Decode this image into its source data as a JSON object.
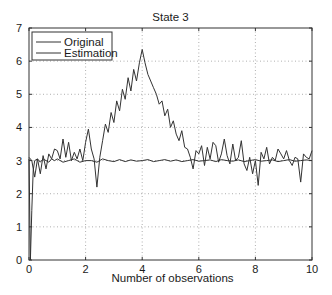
{
  "chart_data": {
    "type": "line",
    "title": "State 3",
    "xlabel": "Number of observations",
    "ylabel": "",
    "xlim": [
      0,
      10
    ],
    "ylim": [
      0,
      7
    ],
    "xticks": [
      0,
      2,
      4,
      6,
      8,
      10
    ],
    "yticks": [
      0,
      1,
      2,
      3,
      4,
      5,
      6,
      7
    ],
    "grid": true,
    "grid_style": "dotted",
    "legend": {
      "position": "upper-left",
      "entries": [
        "Original",
        "Estimation"
      ]
    },
    "series": [
      {
        "name": "Original",
        "color": "#333333",
        "x": [
          0.0,
          0.1,
          0.2,
          0.3,
          0.4,
          0.5,
          0.6,
          0.7,
          0.8,
          0.9,
          1.0,
          1.1,
          1.2,
          1.3,
          1.4,
          1.5,
          1.6,
          1.7,
          1.8,
          1.9,
          2.0,
          2.1,
          2.2,
          2.3,
          2.4,
          2.5,
          2.6,
          2.7,
          2.8,
          2.9,
          3.0,
          3.1,
          3.2,
          3.3,
          3.4,
          3.5,
          3.6,
          3.7,
          3.8,
          3.9,
          4.0,
          4.1,
          4.2,
          4.3,
          4.4,
          4.5,
          4.6,
          4.7,
          4.8,
          4.9,
          5.0,
          5.1,
          5.2,
          5.3,
          5.4,
          5.5,
          5.6,
          5.7,
          5.8,
          5.9,
          6.0,
          6.1,
          6.2,
          6.3,
          6.4,
          6.5,
          6.6,
          6.7,
          6.8,
          6.9,
          7.0,
          7.1,
          7.2,
          7.3,
          7.4,
          7.5,
          7.6,
          7.7,
          7.8,
          7.9,
          8.0,
          8.1,
          8.2,
          8.3,
          8.4,
          8.5,
          8.6,
          8.7,
          8.8,
          8.9,
          9.0,
          9.1,
          9.2,
          9.3,
          9.4,
          9.5,
          9.6,
          9.7,
          9.8,
          9.9,
          10.0
        ],
        "y": [
          3.1,
          3.0,
          2.5,
          3.05,
          2.6,
          3.15,
          2.75,
          3.2,
          3.05,
          3.35,
          3.3,
          3.05,
          3.65,
          3.1,
          3.55,
          3.0,
          3.25,
          3.05,
          3.35,
          3.0,
          3.55,
          3.95,
          3.35,
          3.05,
          2.2,
          3.1,
          3.6,
          4.1,
          3.85,
          4.45,
          4.15,
          4.8,
          4.5,
          5.15,
          4.85,
          5.5,
          5.1,
          5.75,
          5.4,
          5.95,
          6.35,
          5.95,
          5.6,
          5.4,
          5.2,
          5.0,
          4.7,
          4.8,
          4.35,
          4.55,
          4.0,
          4.2,
          3.8,
          3.6,
          3.9,
          3.4,
          3.35,
          3.1,
          2.75,
          3.3,
          3.2,
          3.45,
          2.85,
          3.4,
          3.05,
          3.55,
          3.45,
          2.95,
          3.2,
          3.65,
          3.15,
          2.9,
          3.5,
          3.0,
          3.1,
          3.6,
          2.9,
          2.7,
          3.1,
          2.6,
          3.0,
          2.25,
          3.25,
          3.05,
          3.4,
          2.9,
          3.1,
          3.0,
          3.35,
          3.2,
          3.05,
          3.3,
          3.0,
          2.85,
          3.1,
          3.05,
          2.35,
          3.2,
          3.1,
          3.05,
          3.3
        ]
      },
      {
        "name": "Estimation",
        "color": "#333333",
        "x": [
          0.0,
          0.05,
          0.1,
          0.15,
          0.2,
          0.3,
          0.4,
          0.5,
          0.6,
          0.7,
          0.8,
          0.9,
          1.0,
          1.2,
          1.4,
          1.6,
          1.8,
          2.0,
          2.2,
          2.4,
          2.6,
          2.8,
          3.0,
          3.2,
          3.4,
          3.6,
          3.8,
          4.0,
          4.2,
          4.4,
          4.6,
          4.8,
          5.0,
          5.2,
          5.4,
          5.6,
          5.8,
          6.0,
          6.2,
          6.4,
          6.6,
          6.8,
          7.0,
          7.2,
          7.4,
          7.6,
          7.8,
          8.0,
          8.2,
          8.4,
          8.6,
          8.8,
          9.0,
          9.2,
          9.4,
          9.6,
          9.8,
          10.0
        ],
        "y": [
          3.05,
          0.0,
          1.5,
          2.7,
          3.0,
          3.05,
          2.95,
          3.05,
          3.0,
          2.95,
          3.05,
          3.0,
          3.05,
          2.95,
          3.0,
          3.05,
          2.95,
          3.0,
          3.0,
          2.95,
          3.05,
          3.0,
          2.97,
          3.03,
          2.97,
          3.02,
          2.98,
          3.0,
          3.03,
          2.97,
          3.0,
          3.03,
          2.98,
          3.02,
          2.97,
          3.0,
          3.03,
          2.98,
          3.0,
          3.02,
          2.97,
          3.03,
          3.0,
          2.98,
          3.02,
          2.97,
          3.0,
          3.03,
          2.98,
          3.0,
          3.02,
          2.97,
          3.0,
          3.03,
          2.98,
          3.0,
          3.02,
          3.0
        ]
      }
    ]
  },
  "colors": {
    "axis": "#333333",
    "grid": "#9a9a9a",
    "line": "#333333",
    "background": "#ffffff"
  }
}
